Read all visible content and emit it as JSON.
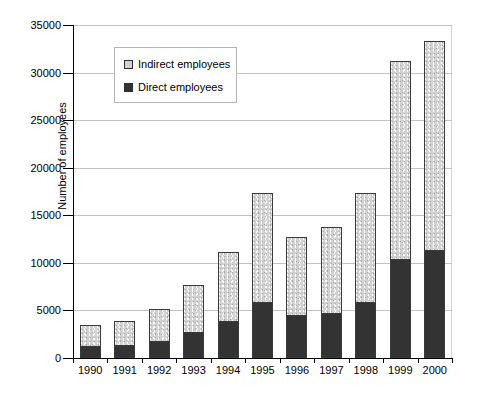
{
  "chart_data": {
    "type": "bar",
    "stacked": true,
    "title": "",
    "xlabel": "",
    "ylabel": "Number of employees",
    "categories": [
      "1990",
      "1991",
      "1992",
      "1993",
      "1994",
      "1995",
      "1996",
      "1997",
      "1998",
      "1999",
      "2000"
    ],
    "series": [
      {
        "name": "Direct employees",
        "values": [
          1300,
          1400,
          1800,
          2700,
          3900,
          5900,
          4500,
          4700,
          5900,
          10400,
          11400
        ]
      },
      {
        "name": "Indirect employees",
        "values": [
          2300,
          2600,
          3500,
          5100,
          7300,
          11500,
          8300,
          9200,
          11600,
          20900,
          22000
        ]
      }
    ],
    "totals": [
      3600,
      4000,
      5300,
      7800,
      11200,
      17400,
      12800,
      13900,
      17500,
      31300,
      33400
    ],
    "ylim": [
      0,
      35000
    ],
    "ytick_values": [
      0,
      5000,
      10000,
      15000,
      20000,
      25000,
      30000,
      35000
    ],
    "ytick_labels": [
      "0",
      "5000",
      "10000",
      "15000",
      "20000",
      "25000",
      "30000",
      "35000"
    ],
    "grid": true,
    "legend_position": "upper-left-inside",
    "colors": {
      "direct": "#333333",
      "indirect": "#d2d2d2",
      "gridline": "#c3c3c3",
      "axis": "#000000"
    }
  },
  "legend": {
    "items": [
      {
        "label": "Indirect employees",
        "swatch": "indirect-swatch-icon"
      },
      {
        "label": "Direct employees",
        "swatch": "direct-swatch-icon"
      }
    ]
  }
}
